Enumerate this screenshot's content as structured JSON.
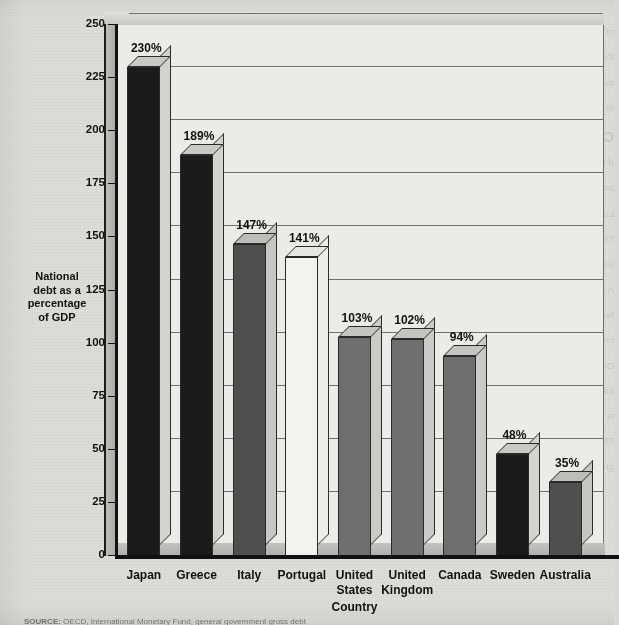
{
  "chart_data": {
    "type": "bar",
    "title": "",
    "xlabel": "Country",
    "ylabel": "National debt as a percentage of GDP",
    "ylim": [
      0,
      250
    ],
    "ytick_step": 25,
    "yticks": [
      "250",
      "225",
      "200",
      "175",
      "150",
      "125",
      "100",
      "75",
      "50",
      "25",
      "0"
    ],
    "grid": true,
    "legend": "none",
    "value_suffix": "%",
    "categories": [
      "Japan",
      "Greece",
      "Italy",
      "Portugal",
      "United\nStates",
      "United\nKingdom",
      "Canada",
      "Sweden",
      "Australia"
    ],
    "values": [
      230,
      189,
      147,
      141,
      103,
      102,
      94,
      48,
      35
    ],
    "value_labels": [
      "230%",
      "189%",
      "147%",
      "141%",
      "103%",
      "102%",
      "94%",
      "48%",
      "35%"
    ],
    "bar_fills": [
      "#1b1b1b",
      "#1b1b1b",
      "#4f4f4f",
      "#f2f2ee",
      "#6e6e6e",
      "#6e6e6e",
      "#6e6e6e",
      "#1b1b1b",
      "#4f4f4f"
    ],
    "bar_top_fills": [
      "#c9c9c5",
      "#c9c9c5",
      "#bdbdb9",
      "#e6e6e2",
      "#c4c4c0",
      "#c4c4c0",
      "#c4c4c0",
      "#c9c9c5",
      "#bdbdb9"
    ],
    "bar_side_fills": [
      "#d2d2ce",
      "#d2d2ce",
      "#c6c6c2",
      "#ededea",
      "#cacac6",
      "#cacac6",
      "#cacac6",
      "#d2d2ce",
      "#c6c6c2"
    ]
  },
  "ylabel_lines": [
    "National",
    "debt as a",
    "percentage",
    "of  GDP"
  ],
  "source": {
    "prefix": "SOURCE:",
    "rest": "  OECD, International Monetary Fund, general government gross debt"
  },
  "colors": {
    "paper": "#dcdcd8",
    "plot_background": "#ebebe7",
    "axis": "#111111",
    "gridline": "#6f6f6f",
    "text": "#111111"
  },
  "showthrough": {
    "heading": "CAN UNCLE SAM GO BANKRUPT?",
    "lines": [
      "of the national debt is held by foreign investors, and when interest is paid to them",
      "the money leaves the country. And debt held abroad rose sharply during the past",
      "decade, from 19 percent of the debt to 34 percent.",
      "In addition, a large national debt may crowd out private investment.",
      "If there is a large national debt and private borrowers compete for the same",
      "pool of savings, interest rates are pushed up, and investment spending falls.",
      "Lower investment today means lower output and income in the future.",
      "The national debt has grown to the point where some wonder if the",
      "government can continue to service it. Could the U.S. government go bankrupt?",
      "A family or a firm can go bankrupt when it cannot pay its bills. But the",
      "federal government is different. It has the power to tax and the power to",
      "create money. The government can always pay its obligations in dollars.",
      "Of course, paying off debt by printing money would create inflation, and",
      "inflation is a tax of its own. Still, outright default on dollar-denominated debt",
      "is not the binding constraint the government faces.",
      "The real issue is not bankruptcy but burden. Interest payments consume a",
      "growing share of the budget, crowding out other spending priorities and",
      "leaving less room for policy to respond when the next recession arrives."
    ]
  }
}
